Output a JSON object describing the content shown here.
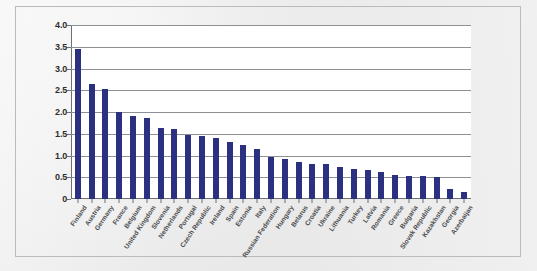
{
  "chart_data": {
    "type": "bar",
    "title": "",
    "xlabel": "",
    "ylabel": "",
    "ylim": [
      0,
      4.0
    ],
    "grid": true,
    "legend": "none",
    "bar_color": "#2b3180",
    "gridline_color": "#8d9094",
    "plot_background": "#ffffff",
    "ytick_labels": [
      "4.0",
      "3.5",
      "3.0",
      "2.5",
      "2.0",
      "1.5",
      "1.0",
      "0.5",
      "0"
    ],
    "ytick_values": [
      4.0,
      3.5,
      3.0,
      2.5,
      2.0,
      1.5,
      1.0,
      0.5,
      0
    ],
    "categories": [
      "Finland",
      "Austria",
      "Germany",
      "France",
      "Belgium",
      "United Kingdom",
      "Slovenia",
      "Netherlands",
      "Portugal",
      "Czech Republic",
      "Ireland",
      "Spain",
      "Estonia",
      "Italy",
      "Russian Federation",
      "Hungary",
      "Belarus",
      "Croatia",
      "Ukraine",
      "Lithuania",
      "Turkey",
      "Latvia",
      "Romania",
      "Greece",
      "Bulgaria",
      "Slovak Republic",
      "Kazakhstan",
      "Georgia",
      "Azerbaijan"
    ],
    "values": [
      3.45,
      2.65,
      2.53,
      2.0,
      1.9,
      1.87,
      1.63,
      1.6,
      1.48,
      1.44,
      1.4,
      1.31,
      1.25,
      1.15,
      0.97,
      0.92,
      0.85,
      0.8,
      0.8,
      0.74,
      0.7,
      0.66,
      0.62,
      0.55,
      0.54,
      0.53,
      0.5,
      0.22,
      0.17
    ]
  },
  "caption": {
    "text": ""
  }
}
